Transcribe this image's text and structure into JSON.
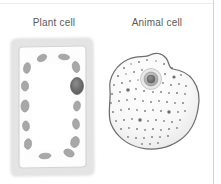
{
  "figure": {
    "background_color": "#ffffff",
    "border_color": "#d2d2d2",
    "width": 221,
    "height": 184
  },
  "labels": {
    "plant": "Plant cell",
    "animal": "Animal cell",
    "text_color": "#5a5a5a"
  },
  "plant_cell": {
    "name": "Plant cell",
    "shape": "rectangular",
    "wall_color": "#e6e6e6",
    "membrane_color": "#d8d8d8",
    "cytoplasm_color": "#fdfdfd",
    "organelle_color": "#a8a8a8",
    "nucleus_color": "#707070",
    "chloroplasts": [
      {
        "cx": 36,
        "cy": 24,
        "rx": 5.0,
        "ry": 3.2,
        "rot": -28
      },
      {
        "cx": 58,
        "cy": 23,
        "rx": 5.6,
        "ry": 2.8,
        "rot": 6
      },
      {
        "cx": 21,
        "cy": 34,
        "rx": 3.4,
        "ry": 5.4,
        "rot": 10
      },
      {
        "cx": 70,
        "cy": 33,
        "rx": 3.6,
        "ry": 5.6,
        "rot": -14
      },
      {
        "cx": 19,
        "cy": 52,
        "rx": 3.6,
        "ry": 5.0,
        "rot": -4
      },
      {
        "cx": 19,
        "cy": 72,
        "rx": 4.0,
        "ry": 6.0,
        "rot": 4
      },
      {
        "cx": 20,
        "cy": 92,
        "rx": 3.4,
        "ry": 5.0,
        "rot": -6
      },
      {
        "cx": 22,
        "cy": 110,
        "rx": 3.6,
        "ry": 5.2,
        "rot": 8
      },
      {
        "cx": 71,
        "cy": 72,
        "rx": 3.4,
        "ry": 5.0,
        "rot": 10
      },
      {
        "cx": 70,
        "cy": 90,
        "rx": 3.4,
        "ry": 5.2,
        "rot": -8
      },
      {
        "cx": 69,
        "cy": 108,
        "rx": 4.2,
        "ry": 5.6,
        "rot": 18
      },
      {
        "cx": 63,
        "cy": 119,
        "rx": 5.4,
        "ry": 3.6,
        "rot": 24
      },
      {
        "cx": 39,
        "cy": 122,
        "rx": 6.0,
        "ry": 2.8,
        "rot": -4
      }
    ],
    "nucleus": {
      "cx": 71,
      "cy": 52,
      "rx": 6.4,
      "ry": 8.4
    }
  },
  "animal_cell": {
    "name": "Animal cell",
    "shape": "irregular-blob",
    "outline_color": "#6e6e6e",
    "cytoplasm_color": "#f6f6f6",
    "organelle_color": "#555555",
    "nucleus_color": "#9a9a9a",
    "nucleolus_color": "#6a6a6a",
    "nucleus": {
      "cx": 53,
      "cy": 33,
      "r_outer": 10.5,
      "r_mid": 7.0,
      "r_inner": 4.0
    },
    "ribosomes": [
      {
        "cx": 26,
        "cy": 22,
        "r": 1.0
      },
      {
        "cx": 33,
        "cy": 18,
        "r": 0.8
      },
      {
        "cx": 41,
        "cy": 16,
        "r": 1.0
      },
      {
        "cx": 49,
        "cy": 14,
        "r": 0.9
      },
      {
        "cx": 58,
        "cy": 15,
        "r": 0.8
      },
      {
        "cx": 66,
        "cy": 18,
        "r": 1.0
      },
      {
        "cx": 74,
        "cy": 22,
        "r": 0.9
      },
      {
        "cx": 20,
        "cy": 30,
        "r": 1.1
      },
      {
        "cx": 28,
        "cy": 28,
        "r": 0.8
      },
      {
        "cx": 36,
        "cy": 26,
        "r": 1.0
      },
      {
        "cx": 44,
        "cy": 24,
        "r": 0.9
      },
      {
        "cx": 67,
        "cy": 28,
        "r": 1.0
      },
      {
        "cx": 76,
        "cy": 31,
        "r": 1.6
      },
      {
        "cx": 83,
        "cy": 29,
        "r": 0.9
      },
      {
        "cx": 16,
        "cy": 39,
        "r": 0.9
      },
      {
        "cx": 24,
        "cy": 37,
        "r": 1.0
      },
      {
        "cx": 32,
        "cy": 35,
        "r": 0.9
      },
      {
        "cx": 40,
        "cy": 34,
        "r": 0.8
      },
      {
        "cx": 65,
        "cy": 37,
        "r": 0.9
      },
      {
        "cx": 73,
        "cy": 39,
        "r": 1.0
      },
      {
        "cx": 81,
        "cy": 38,
        "r": 0.9
      },
      {
        "cx": 88,
        "cy": 40,
        "r": 0.9
      },
      {
        "cx": 14,
        "cy": 48,
        "r": 1.0
      },
      {
        "cx": 22,
        "cy": 46,
        "r": 0.9
      },
      {
        "cx": 30,
        "cy": 44,
        "r": 1.8
      },
      {
        "cx": 38,
        "cy": 43,
        "r": 0.9
      },
      {
        "cx": 46,
        "cy": 45,
        "r": 1.0
      },
      {
        "cx": 55,
        "cy": 46,
        "r": 0.9
      },
      {
        "cx": 63,
        "cy": 46,
        "r": 1.0
      },
      {
        "cx": 71,
        "cy": 47,
        "r": 0.9
      },
      {
        "cx": 79,
        "cy": 47,
        "r": 1.0
      },
      {
        "cx": 87,
        "cy": 48,
        "r": 0.9
      },
      {
        "cx": 13,
        "cy": 57,
        "r": 0.9
      },
      {
        "cx": 21,
        "cy": 55,
        "r": 1.0
      },
      {
        "cx": 29,
        "cy": 54,
        "r": 0.9
      },
      {
        "cx": 37,
        "cy": 53,
        "r": 1.0
      },
      {
        "cx": 45,
        "cy": 55,
        "r": 0.9
      },
      {
        "cx": 53,
        "cy": 56,
        "r": 1.0
      },
      {
        "cx": 61,
        "cy": 55,
        "r": 0.9
      },
      {
        "cx": 69,
        "cy": 56,
        "r": 1.0
      },
      {
        "cx": 77,
        "cy": 57,
        "r": 0.9
      },
      {
        "cx": 85,
        "cy": 57,
        "r": 1.0
      },
      {
        "cx": 15,
        "cy": 66,
        "r": 1.0
      },
      {
        "cx": 23,
        "cy": 64,
        "r": 0.9
      },
      {
        "cx": 31,
        "cy": 63,
        "r": 1.0
      },
      {
        "cx": 39,
        "cy": 64,
        "r": 0.9
      },
      {
        "cx": 47,
        "cy": 65,
        "r": 1.0
      },
      {
        "cx": 55,
        "cy": 64,
        "r": 0.9
      },
      {
        "cx": 63,
        "cy": 65,
        "r": 1.0
      },
      {
        "cx": 71,
        "cy": 66,
        "r": 1.7
      },
      {
        "cx": 80,
        "cy": 66,
        "r": 0.9
      },
      {
        "cx": 87,
        "cy": 65,
        "r": 0.9
      },
      {
        "cx": 18,
        "cy": 75,
        "r": 0.9
      },
      {
        "cx": 26,
        "cy": 74,
        "r": 1.0
      },
      {
        "cx": 34,
        "cy": 73,
        "r": 0.9
      },
      {
        "cx": 42,
        "cy": 74,
        "r": 1.8
      },
      {
        "cx": 50,
        "cy": 75,
        "r": 0.9
      },
      {
        "cx": 58,
        "cy": 74,
        "r": 1.0
      },
      {
        "cx": 66,
        "cy": 75,
        "r": 0.9
      },
      {
        "cx": 74,
        "cy": 76,
        "r": 1.0
      },
      {
        "cx": 82,
        "cy": 74,
        "r": 0.9
      },
      {
        "cx": 23,
        "cy": 83,
        "r": 1.0
      },
      {
        "cx": 31,
        "cy": 82,
        "r": 0.9
      },
      {
        "cx": 39,
        "cy": 83,
        "r": 1.0
      },
      {
        "cx": 47,
        "cy": 84,
        "r": 0.9
      },
      {
        "cx": 55,
        "cy": 83,
        "r": 1.0
      },
      {
        "cx": 63,
        "cy": 84,
        "r": 0.9
      },
      {
        "cx": 71,
        "cy": 83,
        "r": 1.0
      },
      {
        "cx": 79,
        "cy": 82,
        "r": 0.9
      },
      {
        "cx": 30,
        "cy": 91,
        "r": 0.9
      },
      {
        "cx": 38,
        "cy": 92,
        "r": 1.0
      },
      {
        "cx": 46,
        "cy": 92,
        "r": 0.9
      },
      {
        "cx": 54,
        "cy": 91,
        "r": 1.0
      },
      {
        "cx": 62,
        "cy": 91,
        "r": 0.9
      },
      {
        "cx": 70,
        "cy": 90,
        "r": 1.0
      },
      {
        "cx": 44,
        "cy": 98,
        "r": 0.9
      },
      {
        "cx": 52,
        "cy": 98,
        "r": 0.9
      },
      {
        "cx": 60,
        "cy": 97,
        "r": 0.9
      }
    ]
  }
}
